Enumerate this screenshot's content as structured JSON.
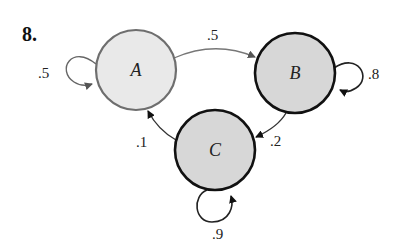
{
  "problem_number": "8.",
  "colors": {
    "node_a_fill": "#e9e9e9",
    "node_a_stroke": "#6e6e6e",
    "node_bc_fill": "#d7d7d7",
    "node_bc_stroke": "#111111",
    "edge_gray": "#707070",
    "edge_dark": "#333333"
  },
  "nodes": [
    {
      "id": "A",
      "label": "A"
    },
    {
      "id": "B",
      "label": "B"
    },
    {
      "id": "C",
      "label": "C"
    }
  ],
  "edges": [
    {
      "from": "A",
      "to": "A",
      "label": ".5"
    },
    {
      "from": "A",
      "to": "B",
      "label": ".5"
    },
    {
      "from": "B",
      "to": "B",
      "label": ".8"
    },
    {
      "from": "B",
      "to": "C",
      "label": ".2"
    },
    {
      "from": "C",
      "to": "A",
      "label": ".1"
    },
    {
      "from": "C",
      "to": "C",
      "label": ".9"
    }
  ]
}
